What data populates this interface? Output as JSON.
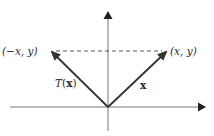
{
  "figure": {
    "colors": {
      "background": "#ffffff",
      "axes": "#555555",
      "vectors": "#333333",
      "dashed_line": "#444444",
      "text": "#2a2a2a"
    },
    "origin": {
      "x": 108,
      "y": 107
    },
    "axes": {
      "x_axis": {
        "from": [
          10,
          107
        ],
        "to": [
          205,
          107
        ],
        "arrow": "right"
      },
      "y_axis": {
        "from": [
          108,
          131
        ],
        "to": [
          108,
          13
        ],
        "arrow": "up"
      }
    },
    "vectors": [
      {
        "name": "x",
        "from": [
          108,
          107
        ],
        "to": [
          166,
          52
        ],
        "label": "x",
        "label_style": "bold"
      },
      {
        "name": "T(x)",
        "from": [
          108,
          107
        ],
        "to": [
          52,
          52
        ],
        "label": "T(x)"
      }
    ],
    "dashed_line": {
      "from": [
        52,
        51
      ],
      "to": [
        166,
        51
      ]
    },
    "labels": {
      "left_point": "(−x, y)",
      "right_point": "(x, y)",
      "transform_T": "T",
      "transform_open": "(",
      "transform_arg": "x",
      "transform_close": ")",
      "vector_x": "x"
    }
  }
}
